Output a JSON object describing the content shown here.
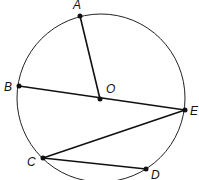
{
  "diagram": {
    "title": "",
    "circle": {
      "cx": 101,
      "cy": 98,
      "r": 84,
      "center_label": "O"
    },
    "points": [
      {
        "id": "A",
        "label": "A",
        "x": 80,
        "y": 16,
        "lx": 73,
        "ly": 9
      },
      {
        "id": "O",
        "label": "O",
        "x": 100,
        "y": 99,
        "lx": 106,
        "ly": 93
      },
      {
        "id": "B",
        "label": "B",
        "x": 19,
        "y": 86,
        "lx": 4,
        "ly": 91
      },
      {
        "id": "E",
        "label": "E",
        "x": 185,
        "y": 110,
        "lx": 190,
        "ly": 115
      },
      {
        "id": "C",
        "label": "C",
        "x": 43,
        "y": 158,
        "lx": 27,
        "ly": 166
      },
      {
        "id": "D",
        "label": "D",
        "x": 146,
        "y": 169,
        "lx": 151,
        "ly": 179
      }
    ],
    "segments": [
      {
        "from": "A",
        "to": "O"
      },
      {
        "from": "B",
        "to": "E"
      },
      {
        "from": "E",
        "to": "C"
      },
      {
        "from": "C",
        "to": "D"
      }
    ]
  }
}
